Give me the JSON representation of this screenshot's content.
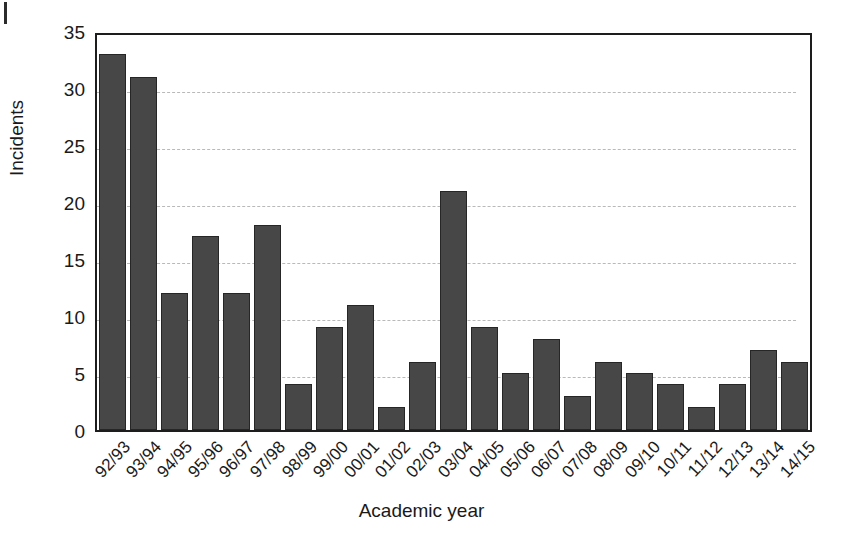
{
  "chart_data": {
    "type": "bar",
    "title": "",
    "xlabel": "Academic year",
    "ylabel": "Incidents",
    "categories": [
      "92/93",
      "93/94",
      "94/95",
      "95/96",
      "96/97",
      "97/98",
      "98/99",
      "99/00",
      "00/01",
      "01/02",
      "02/03",
      "03/04",
      "04/05",
      "05/06",
      "06/07",
      "07/08",
      "08/09",
      "09/10",
      "10/11",
      "11/12",
      "12/13",
      "13/14",
      "14/15"
    ],
    "values": [
      33,
      31,
      12,
      17,
      12,
      18,
      4,
      9,
      11,
      2,
      6,
      21,
      9,
      5,
      8,
      3,
      6,
      5,
      4,
      2,
      4,
      7,
      6
    ],
    "ylim": [
      0,
      35
    ],
    "yticks": [
      0,
      5,
      10,
      15,
      20,
      25,
      30,
      35
    ],
    "ytick_labels": [
      "0",
      "5",
      "10",
      "15",
      "20",
      "25",
      "30",
      "35"
    ],
    "grid": true,
    "grid_axis": "y",
    "grid_style": "dashed",
    "legend": false,
    "bar_color": "#474747",
    "bar_edge_color": "#262626",
    "grid_color": "#b9b9b9",
    "frame_color": "#1d1d1d",
    "background_color": "#ffffff"
  }
}
